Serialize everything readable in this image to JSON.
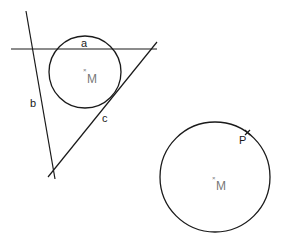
{
  "figure1": {
    "lines": {
      "a": {
        "label": "a",
        "x1": 11,
        "y1": 49,
        "x2": 157,
        "y2": 49
      },
      "b": {
        "label": "b",
        "x1": 26,
        "y1": 11,
        "x2": 55,
        "y2": 179
      },
      "c": {
        "label": "c",
        "x1": 48,
        "y1": 177,
        "x2": 157,
        "y2": 42
      }
    },
    "circle": {
      "cx": 85,
      "cy": 72,
      "r": 36
    },
    "center": {
      "label": "M",
      "mark": "×"
    }
  },
  "figure2": {
    "circle": {
      "cx": 215,
      "cy": 177,
      "r": 55
    },
    "center": {
      "label": "M",
      "mark": "×"
    },
    "point": {
      "label": "P",
      "mark": "×"
    }
  },
  "colors": {
    "stroke": "#1a1a1a",
    "center_label": "#777777"
  }
}
